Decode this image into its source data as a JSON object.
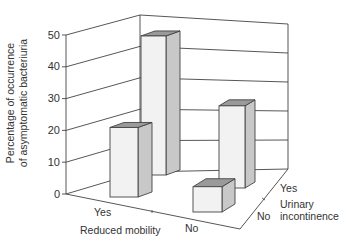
{
  "chart_data": {
    "type": "bar",
    "subtype": "3d-grouped",
    "title": "",
    "ylabel": "Percentage of occurrence of asymptomatic bacteriuria",
    "ylabel_lines": [
      "Percentage of occurrence",
      "of asymptomatic bacteriuria"
    ],
    "xlabel": "Reduced mobility",
    "zlabel": "Urinary incontinence",
    "zlabel_lines": [
      "Urinary",
      "incontinence"
    ],
    "x_categories": [
      "Yes",
      "No"
    ],
    "z_categories": [
      "No",
      "Yes"
    ],
    "yticks": [
      0,
      10,
      20,
      30,
      40,
      50
    ],
    "ylim": [
      0,
      50
    ],
    "grid": true,
    "bars": [
      {
        "reduced_mobility": "Yes",
        "urinary_incontinence": "Yes",
        "value": 44
      },
      {
        "reduced_mobility": "Yes",
        "urinary_incontinence": "No",
        "value": 22
      },
      {
        "reduced_mobility": "No",
        "urinary_incontinence": "Yes",
        "value": 26
      },
      {
        "reduced_mobility": "No",
        "urinary_incontinence": "No",
        "value": 8
      }
    ],
    "colors": {
      "front": "#f2f2f2",
      "side": "#c8c8c8",
      "top": "#9a9a9a",
      "edge": "#444444",
      "grid": "#444444"
    }
  },
  "labels": {
    "x_yes": "Yes",
    "x_no": "No",
    "x_title": "Reduced mobility",
    "z_yes": "Yes",
    "z_no": "No",
    "z_title_1": "Urinary",
    "z_title_2": "incontinence",
    "y_title_1": "Percentage of occurrence",
    "y_title_2": "of asymptomatic bacteriuria",
    "ticks": [
      "0",
      "10",
      "20",
      "30",
      "40",
      "50"
    ]
  }
}
